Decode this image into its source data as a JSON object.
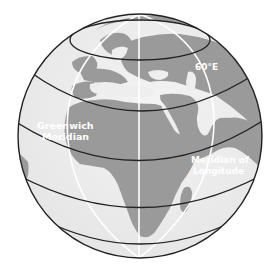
{
  "figure": {
    "labels": {
      "sixty_east": "60°E",
      "greenwich_line1": "Greenwich",
      "greenwich_line2": "Meridian",
      "meridian_line1": "Meridian of",
      "meridian_line2": "Longitude"
    },
    "colors": {
      "ocean": "#eeeeee",
      "land": "#9a9a9a",
      "parallels": "#222222",
      "meridians": "#ffffff",
      "outline": "#222222"
    }
  }
}
